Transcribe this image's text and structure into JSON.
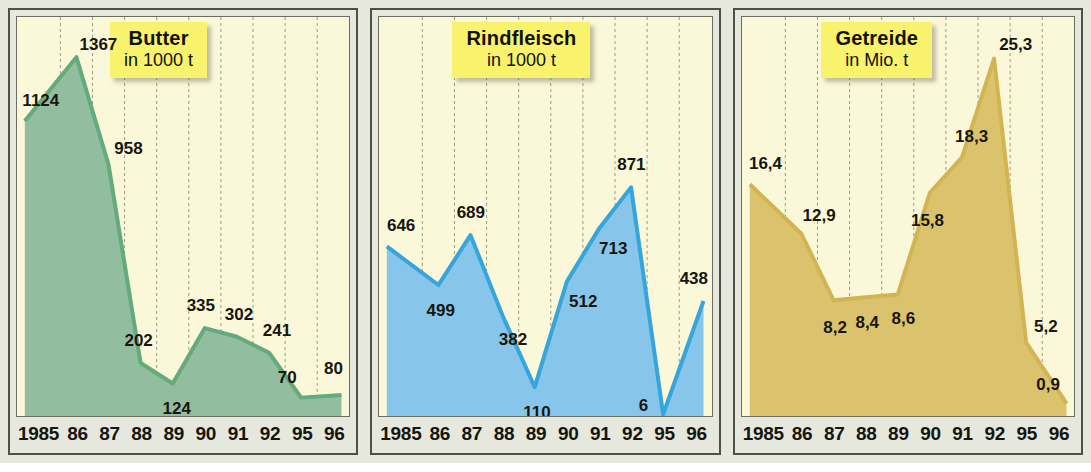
{
  "figure": {
    "background_color": "#e6e7dd",
    "panel_border_color": "#4d5145",
    "plot_background_color": "#fbf8da",
    "gridline_color": "#9a9a82"
  },
  "chart_data": [
    {
      "type": "area",
      "title": "Butter",
      "subtitle": "in 1000 t",
      "xlabel": "",
      "ylabel": "",
      "unit": "1000 t",
      "fill_color": "#92bd9f",
      "line_color": "#63aa7c",
      "ylim": [
        0,
        1480
      ],
      "grid": true,
      "legend": "none",
      "categories": [
        "1985",
        "86",
        "87",
        "88",
        "89",
        "90",
        "91",
        "92",
        "95",
        "96"
      ],
      "values": [
        1124,
        1367,
        958,
        202,
        124,
        335,
        302,
        241,
        70,
        80
      ],
      "labels": [
        "1124",
        "1367",
        "958",
        "202",
        "124",
        "335",
        "302",
        "241",
        "70",
        "80"
      ]
    },
    {
      "type": "area",
      "title": "Rindfleisch",
      "subtitle": "in 1000 t",
      "xlabel": "",
      "ylabel": "",
      "unit": "1000 t",
      "fill_color": "#87c6ea",
      "line_color": "#35a5dc",
      "ylim": [
        0,
        1480
      ],
      "grid": true,
      "legend": "none",
      "categories": [
        "1985",
        "86",
        "87",
        "88",
        "89",
        "90",
        "91",
        "92",
        "95",
        "96"
      ],
      "values": [
        646,
        499,
        689,
        382,
        110,
        512,
        713,
        871,
        6,
        438
      ],
      "labels": [
        "646",
        "499",
        "689",
        "382",
        "110",
        "512",
        "713",
        "871",
        "6",
        "438"
      ]
    },
    {
      "type": "area",
      "title": "Getreide",
      "subtitle": "in Mio. t",
      "xlabel": "",
      "ylabel": "",
      "unit": "Mio. t",
      "fill_color": "#dbc36e",
      "line_color": "#d2b552",
      "ylim": [
        0,
        27.5
      ],
      "grid": true,
      "legend": "none",
      "categories": [
        "1985",
        "86",
        "87",
        "88",
        "89",
        "90",
        "91",
        "92",
        "95",
        "96"
      ],
      "values": [
        16.4,
        12.9,
        8.2,
        8.4,
        8.6,
        15.8,
        18.3,
        25.3,
        5.2,
        0.9
      ],
      "labels": [
        "16,4",
        "12,9",
        "8,2",
        "8,4",
        "8,6",
        "15,8",
        "18,3",
        "25,3",
        "5,2",
        "0,9"
      ]
    }
  ],
  "label_offsets": [
    [
      {
        "dx": 16,
        "dy": -20
      },
      {
        "dx": 22,
        "dy": -12
      },
      {
        "dx": 20,
        "dy": -16
      },
      {
        "dx": -2,
        "dy": -22
      },
      {
        "dx": 4,
        "dy": 26
      },
      {
        "dx": -4,
        "dy": -22
      },
      {
        "dx": 2,
        "dy": -22
      },
      {
        "dx": 8,
        "dy": -22
      },
      {
        "dx": -14,
        "dy": -20
      },
      {
        "dx": -8,
        "dy": -26
      }
    ],
    [
      {
        "dx": 14,
        "dy": -20
      },
      {
        "dx": 2,
        "dy": 26
      },
      {
        "dx": 0,
        "dy": -22
      },
      {
        "dx": 10,
        "dy": 24
      },
      {
        "dx": 2,
        "dy": 26
      },
      {
        "dx": 16,
        "dy": 20
      },
      {
        "dx": 14,
        "dy": 20
      },
      {
        "dx": 0,
        "dy": -22
      },
      {
        "dx": -20,
        "dy": -8
      },
      {
        "dx": -10,
        "dy": -22
      }
    ],
    [
      {
        "dx": 16,
        "dy": -20
      },
      {
        "dx": 18,
        "dy": -18
      },
      {
        "dx": 2,
        "dy": 28
      },
      {
        "dx": 2,
        "dy": 26
      },
      {
        "dx": 6,
        "dy": 24
      },
      {
        "dx": -2,
        "dy": 28
      },
      {
        "dx": 10,
        "dy": -20
      },
      {
        "dx": 22,
        "dy": -14
      },
      {
        "dx": 20,
        "dy": -16
      },
      {
        "dx": -18,
        "dy": -18
      }
    ]
  ]
}
